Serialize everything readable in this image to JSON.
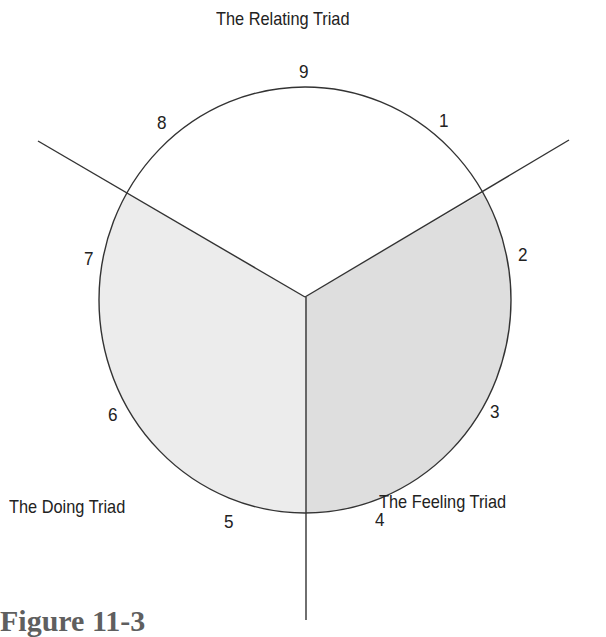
{
  "diagram": {
    "title_top": "The Relating Triad",
    "label_left": "The Doing Triad",
    "label_right": "The Feeling Triad",
    "numbers": {
      "n1": "1",
      "n2": "2",
      "n3": "3",
      "n4": "4",
      "n5": "5",
      "n6": "6",
      "n7": "7",
      "n8": "8",
      "n9": "9"
    },
    "colors": {
      "line": "#333333",
      "doing_fill": "#ececec",
      "feeling_fill": "#dedede",
      "relating_fill": "#ffffff",
      "text": "#222222"
    }
  },
  "caption": "Figure 11-3"
}
